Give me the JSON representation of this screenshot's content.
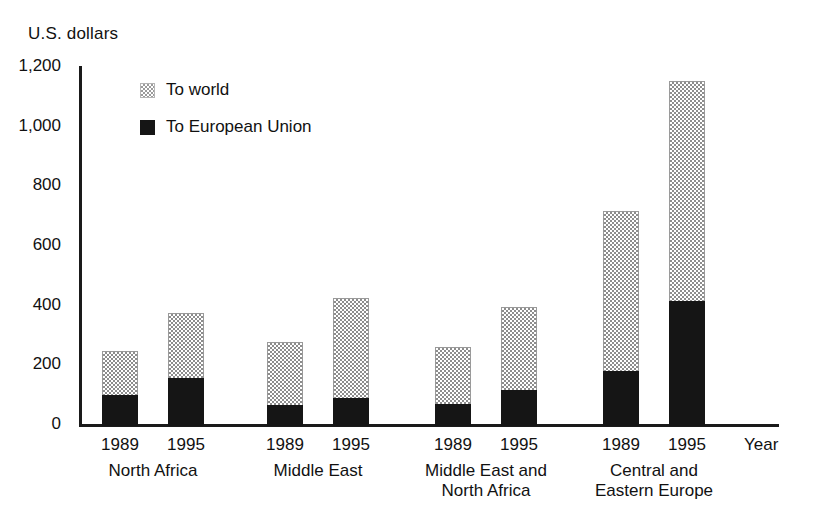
{
  "chart_data": {
    "type": "bar",
    "subtype": "stacked-grouped",
    "title": "",
    "ylabel": "U.S. dollars",
    "xlabel": "Year",
    "ylim": [
      0,
      1200
    ],
    "yticks": [
      "0",
      "200",
      "400",
      "600",
      "800",
      "1,000",
      "1,200"
    ],
    "ytick_values": [
      0,
      200,
      400,
      600,
      800,
      1000,
      1200
    ],
    "grid": false,
    "legend_position": "upper-left-inside",
    "legend": [
      {
        "name": "To world",
        "swatch": "world"
      },
      {
        "name": "To European Union",
        "swatch": "eu"
      }
    ],
    "series": [
      {
        "name": "To world",
        "values": [
          250,
          380,
          280,
          430,
          265,
          400,
          720,
          1155
        ]
      },
      {
        "name": "To European Union",
        "values": [
          105,
          160,
          70,
          95,
          75,
          120,
          185,
          420
        ]
      }
    ],
    "groups": [
      {
        "label": [
          "North Africa"
        ],
        "bars": [
          {
            "year": "1989",
            "to_world": 250,
            "to_european_union": 105
          },
          {
            "year": "1995",
            "to_world": 380,
            "to_european_union": 160
          }
        ]
      },
      {
        "label": [
          "Middle East"
        ],
        "bars": [
          {
            "year": "1989",
            "to_world": 280,
            "to_european_union": 70
          },
          {
            "year": "1995",
            "to_world": 430,
            "to_european_union": 95
          }
        ]
      },
      {
        "label": [
          "Middle East and",
          "North Africa"
        ],
        "bars": [
          {
            "year": "1989",
            "to_world": 265,
            "to_european_union": 75
          },
          {
            "year": "1995",
            "to_world": 400,
            "to_european_union": 120
          }
        ]
      },
      {
        "label": [
          "Central and",
          "Eastern Europe"
        ],
        "bars": [
          {
            "year": "1989",
            "to_world": 720,
            "to_european_union": 185
          },
          {
            "year": "1995",
            "to_world": 1155,
            "to_european_union": 420
          }
        ]
      }
    ],
    "colors": {
      "to_world": "#8d8d8d",
      "to_european_union": "#151515",
      "axis": "#1a1a1a",
      "background": "#ffffff",
      "text": "#111111"
    }
  }
}
